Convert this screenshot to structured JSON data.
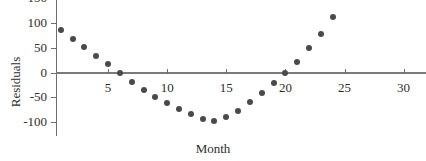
{
  "chart_data": {
    "type": "scatter",
    "title": "",
    "xlabel": "Month",
    "ylabel": "Residuals",
    "xlim": [
      0,
      31
    ],
    "ylim": [
      -130,
      150
    ],
    "grid": false,
    "legend": null,
    "xticks": [
      5,
      10,
      15,
      20,
      25,
      30
    ],
    "xtick_labels": [
      "5",
      "10",
      "15",
      "20",
      "25",
      "30"
    ],
    "yticks": [
      150,
      100,
      50,
      0,
      -50,
      -100
    ],
    "ytick_labels": [
      "150",
      "100",
      "50",
      "0",
      "-50",
      "-100"
    ],
    "zero_line": 0,
    "marker_color": "#4a4a4a",
    "axis_color": "#6f6f6f",
    "series": [
      {
        "name": "Residuals",
        "x": [
          1,
          2,
          3,
          4,
          5,
          6,
          7,
          8,
          9,
          10,
          11,
          12,
          13,
          14,
          15,
          16,
          17,
          18,
          19,
          20,
          21,
          22,
          23,
          24,
          25
        ],
        "y": [
          87,
          67,
          51,
          34,
          18,
          -1,
          -19,
          -36,
          -50,
          -61,
          -74,
          -85,
          -94,
          -99,
          -90,
          -78,
          -60,
          -42,
          -22,
          -1,
          22,
          49,
          78,
          113,
          113
        ]
      }
    ],
    "points": [
      {
        "x": 1,
        "y": 87
      },
      {
        "x": 2,
        "y": 67
      },
      {
        "x": 3,
        "y": 51
      },
      {
        "x": 4,
        "y": 34
      },
      {
        "x": 5,
        "y": 18
      },
      {
        "x": 6,
        "y": -1
      },
      {
        "x": 7,
        "y": -19
      },
      {
        "x": 8,
        "y": -36
      },
      {
        "x": 9,
        "y": -50
      },
      {
        "x": 10,
        "y": -61
      },
      {
        "x": 11,
        "y": -74
      },
      {
        "x": 12,
        "y": -85
      },
      {
        "x": 13,
        "y": -94
      },
      {
        "x": 14,
        "y": -99
      },
      {
        "x": 15,
        "y": -90
      },
      {
        "x": 16,
        "y": -78
      },
      {
        "x": 17,
        "y": -60
      },
      {
        "x": 18,
        "y": -42
      },
      {
        "x": 19,
        "y": -22
      },
      {
        "x": 20,
        "y": -1
      },
      {
        "x": 21,
        "y": 22
      },
      {
        "x": 22,
        "y": 49
      },
      {
        "x": 23,
        "y": 78
      },
      {
        "x": 24,
        "y": 113
      }
    ]
  },
  "axes": {
    "ylabel": "Residuals",
    "xlabel": "Month"
  }
}
